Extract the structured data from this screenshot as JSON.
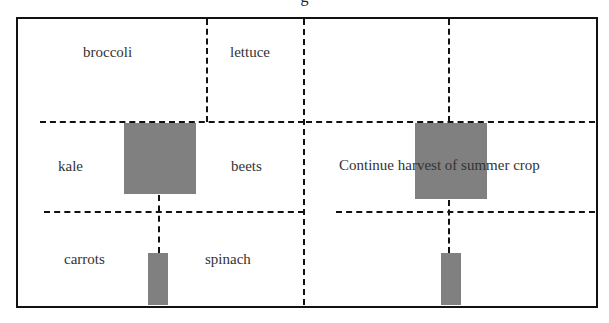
{
  "title": "g",
  "labels": {
    "broccoli": "broccoli",
    "lettuce": "lettuce",
    "kale": "kale",
    "beets": "beets",
    "carrots": "carrots",
    "spinach": "spinach",
    "summer_note": "Continue harvest of summer crop"
  },
  "colors": {
    "line": "#111111",
    "block": "#808080",
    "background": "#ffffff"
  }
}
